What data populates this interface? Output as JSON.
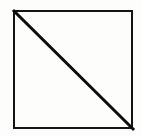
{
  "figure": {
    "title": "Square with diagonal",
    "canvas": {
      "width": 142,
      "height": 136,
      "background_color": "#fdfdfc"
    },
    "shapes": {
      "square": {
        "name": "square-outline",
        "x": 13,
        "y": 10,
        "width": 120,
        "height": 119,
        "stroke_color": "#141414",
        "stroke_width": 2,
        "fill": "none"
      },
      "diagonal": {
        "name": "diagonal-line",
        "x1": 13,
        "y1": 10,
        "x2": 133,
        "y2": 129,
        "stroke_color": "#0d0d0d",
        "stroke_width": 3,
        "direction": "top-left-to-bottom-right"
      }
    },
    "caption": ""
  }
}
